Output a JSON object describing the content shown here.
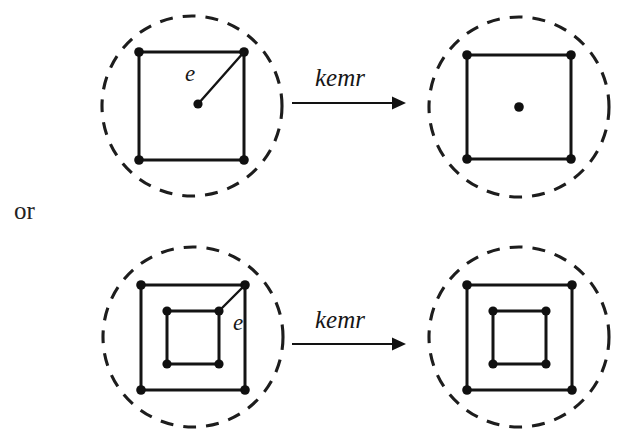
{
  "figure": {
    "caption_partial": "",
    "connector_label": "or",
    "background_color": "#ffffff",
    "ink_color": "#141414",
    "panels": [
      {
        "id": "top-left",
        "role": "source",
        "row": "top",
        "enclosure": "dashed-circle",
        "center": [
          192,
          106
        ],
        "radius": 90,
        "squares": [
          {
            "name": "outer-square",
            "x1": 139,
            "y1": 52,
            "x2": 244,
            "y2": 160,
            "nodes": [
              [
                139,
                52
              ],
              [
                244,
                52
              ],
              [
                139,
                160
              ],
              [
                244,
                160
              ]
            ]
          }
        ],
        "center_node": [
          198,
          104
        ],
        "edge": {
          "name": "edge-e",
          "from": [
            198,
            104
          ],
          "to": [
            244,
            52
          ],
          "label": "e",
          "label_pos": [
            196,
            80
          ]
        }
      },
      {
        "id": "top-right",
        "role": "target",
        "row": "top",
        "enclosure": "dashed-circle",
        "center": [
          519,
          107
        ],
        "radius": 90,
        "squares": [
          {
            "name": "outer-square",
            "x1": 467,
            "y1": 55,
            "x2": 571,
            "y2": 159,
            "nodes": [
              [
                467,
                55
              ],
              [
                571,
                55
              ],
              [
                467,
                159
              ],
              [
                571,
                159
              ]
            ]
          }
        ],
        "center_node": [
          519,
          107
        ],
        "edge": null
      },
      {
        "id": "bottom-left",
        "role": "source",
        "row": "bottom",
        "enclosure": "dashed-circle",
        "center": [
          193,
          337
        ],
        "radius": 90,
        "squares": [
          {
            "name": "outer-square",
            "x1": 141,
            "y1": 285,
            "x2": 245,
            "y2": 390,
            "nodes": [
              [
                141,
                285
              ],
              [
                245,
                285
              ],
              [
                141,
                390
              ],
              [
                245,
                390
              ]
            ]
          },
          {
            "name": "inner-square",
            "x1": 167,
            "y1": 311,
            "x2": 219,
            "y2": 364,
            "nodes": [
              [
                167,
                311
              ],
              [
                219,
                311
              ],
              [
                167,
                364
              ],
              [
                219,
                364
              ]
            ]
          }
        ],
        "center_node": null,
        "edge": {
          "name": "edge-e",
          "from": [
            219,
            311
          ],
          "to": [
            245,
            285
          ],
          "label": "e",
          "label_pos": [
            232,
            330
          ]
        }
      },
      {
        "id": "bottom-right",
        "role": "target",
        "row": "bottom",
        "enclosure": "dashed-circle",
        "center": [
          519,
          337
        ],
        "radius": 90,
        "squares": [
          {
            "name": "outer-square",
            "x1": 467,
            "y1": 285,
            "x2": 572,
            "y2": 390,
            "nodes": [
              [
                467,
                285
              ],
              [
                572,
                285
              ],
              [
                467,
                390
              ],
              [
                572,
                390
              ]
            ]
          },
          {
            "name": "inner-square",
            "x1": 493,
            "y1": 311,
            "x2": 546,
            "y2": 364,
            "nodes": [
              [
                493,
                311
              ],
              [
                546,
                311
              ],
              [
                493,
                364
              ],
              [
                546,
                364
              ]
            ]
          }
        ],
        "center_node": null,
        "edge": null
      }
    ],
    "arrows": [
      {
        "id": "arrow-top",
        "label": "kemr",
        "label_pos": [
          336,
          79
        ],
        "x1": 292,
        "y1": 103,
        "x2": 400,
        "y2": 103
      },
      {
        "id": "arrow-bottom",
        "label": "kemr",
        "label_pos": [
          336,
          321
        ],
        "x1": 292,
        "y1": 344,
        "x2": 400,
        "y2": 344
      }
    ],
    "or_label": {
      "text": "or",
      "x": 14,
      "y": 218
    },
    "node_radius": 4.6,
    "labels": {
      "edge_label_top": "e",
      "edge_label_bottom": "e",
      "arrow_label_top": "kemr",
      "arrow_label_bottom": "kemr"
    }
  }
}
